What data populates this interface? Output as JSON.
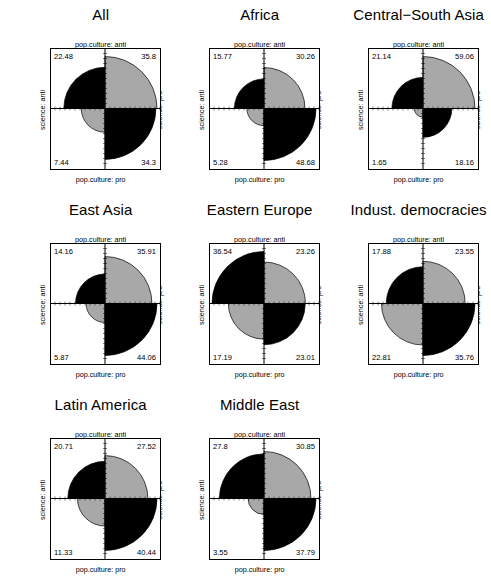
{
  "figure": {
    "type": "fourfold-plot-matrix",
    "background": "#ffffff",
    "quadrant_colors": {
      "black": "#000000",
      "grey": "#a8a8a8",
      "border": "#000000"
    },
    "axis_labels": {
      "top": "pop.culture: anti",
      "bottom": "pop.culture: pro",
      "left": "science: anti",
      "right": "science: pro"
    },
    "grid": {
      "rows": 3,
      "cols": 3,
      "panels_used": 8
    }
  },
  "chart_data": {
    "type": "pie",
    "title": "",
    "xlabel": "pop.culture",
    "ylabel": "science",
    "quadrant_order": [
      "top-left",
      "top-right",
      "bottom-left",
      "bottom-right"
    ],
    "quadrant_meaning": {
      "top-left": "science: anti / pop.culture: anti",
      "top-right": "science: pro / pop.culture: anti",
      "bottom-left": "science: anti / pop.culture: pro",
      "bottom-right": "science: pro / pop.culture: pro"
    },
    "panels": [
      {
        "title": "All",
        "row": 0,
        "col": 0,
        "values": {
          "tl": 22.48,
          "tr": 35.8,
          "bl": 7.44,
          "br": 34.3
        },
        "labels": {
          "tl": "22.48",
          "tr": "35.8",
          "bl": "7.44",
          "br": "34.3"
        },
        "fills": {
          "tl": "black",
          "tr": "grey",
          "bl": "grey",
          "br": "black"
        }
      },
      {
        "title": "Africa",
        "row": 0,
        "col": 1,
        "values": {
          "tl": 15.77,
          "tr": 30.26,
          "bl": 5.28,
          "br": 48.68
        },
        "labels": {
          "tl": "15.77",
          "tr": "30.26",
          "bl": "5.28",
          "br": "48.68"
        },
        "fills": {
          "tl": "black",
          "tr": "grey",
          "bl": "grey",
          "br": "black"
        }
      },
      {
        "title": "Central−South Asia",
        "row": 0,
        "col": 2,
        "values": {
          "tl": 21.14,
          "tr": 59.06,
          "bl": 1.65,
          "br": 18.16
        },
        "labels": {
          "tl": "21.14",
          "tr": "59.06",
          "bl": "1.65",
          "br": "18.16"
        },
        "fills": {
          "tl": "black",
          "tr": "grey",
          "bl": "grey",
          "br": "black"
        }
      },
      {
        "title": "East Asia",
        "row": 1,
        "col": 0,
        "values": {
          "tl": 14.16,
          "tr": 35.91,
          "bl": 5.87,
          "br": 44.06
        },
        "labels": {
          "tl": "14.16",
          "tr": "35.91",
          "bl": "5.87",
          "br": "44.06"
        },
        "fills": {
          "tl": "black",
          "tr": "grey",
          "bl": "grey",
          "br": "black"
        }
      },
      {
        "title": "Eastern Europe",
        "row": 1,
        "col": 1,
        "values": {
          "tl": 36.54,
          "tr": 23.26,
          "bl": 17.19,
          "br": 23.01
        },
        "labels": {
          "tl": "36.54",
          "tr": "23.26",
          "bl": "17.19",
          "br": "23.01"
        },
        "fills": {
          "tl": "black",
          "tr": "grey",
          "bl": "grey",
          "br": "black"
        }
      },
      {
        "title": "Indust. democracies",
        "row": 1,
        "col": 2,
        "values": {
          "tl": 17.88,
          "tr": 23.55,
          "bl": 22.81,
          "br": 35.76
        },
        "labels": {
          "tl": "17.88",
          "tr": "23.55",
          "bl": "22.81",
          "br": "35.76"
        },
        "fills": {
          "tl": "black",
          "tr": "grey",
          "bl": "grey",
          "br": "black"
        }
      },
      {
        "title": "Latin America",
        "row": 2,
        "col": 0,
        "values": {
          "tl": 20.71,
          "tr": 27.52,
          "bl": 11.33,
          "br": 40.44
        },
        "labels": {
          "tl": "20.71",
          "tr": "27.52",
          "bl": "11.33",
          "br": "40.44"
        },
        "fills": {
          "tl": "black",
          "tr": "grey",
          "bl": "grey",
          "br": "black"
        }
      },
      {
        "title": "Middle East",
        "row": 2,
        "col": 1,
        "values": {
          "tl": 27.8,
          "tr": 30.85,
          "bl": 3.55,
          "br": 37.79
        },
        "labels": {
          "tl": "27.8",
          "tr": "30.85",
          "bl": "3.55",
          "br": "37.79"
        },
        "fills": {
          "tl": "black",
          "tr": "grey",
          "bl": "grey",
          "br": "black"
        }
      }
    ]
  }
}
